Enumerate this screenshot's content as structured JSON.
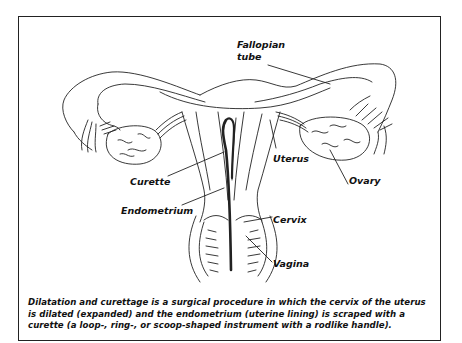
{
  "figure": {
    "labels": {
      "fallopian_tube_line1": "Fallopian",
      "fallopian_tube_line2": "tube",
      "uterus": "Uterus",
      "ovary": "Ovary",
      "curette": "Curette",
      "endometrium": "Endometrium",
      "cervix": "Cervix",
      "vagina": "Vagina"
    },
    "caption": "Dilatation and curettage is a surgical procedure in which the cervix of the uterus is dilated (expanded) and the endometrium (uterine lining) is scraped with a curette (a loop-, ring-, or scoop-shaped instrument with a rodlike handle).",
    "colors": {
      "line": "#222222",
      "background": "#ffffff"
    }
  }
}
